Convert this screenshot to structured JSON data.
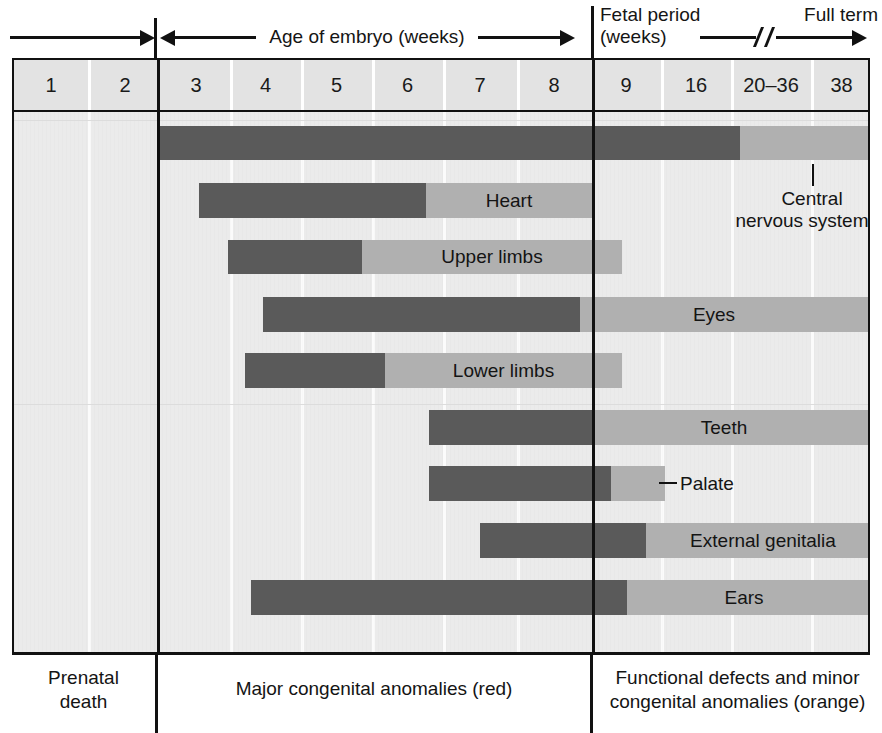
{
  "figure": {
    "axis": {
      "left_segment_label": "",
      "embryo_label": "Age of embryo (weeks)",
      "fetal_label_line1": "Fetal period",
      "fetal_label_line2": "(weeks)",
      "full_term_label": "Full term"
    },
    "week_columns": [
      {
        "label": "1",
        "left": 0,
        "width": 74
      },
      {
        "label": "2",
        "left": 74,
        "width": 74
      },
      {
        "label": "3",
        "left": 148,
        "width": 68
      },
      {
        "label": "4",
        "left": 216,
        "width": 71
      },
      {
        "label": "5",
        "left": 287,
        "width": 71
      },
      {
        "label": "6",
        "left": 358,
        "width": 71
      },
      {
        "label": "7",
        "left": 429,
        "width": 74
      },
      {
        "label": "8",
        "left": 503,
        "width": 74
      },
      {
        "label": "9",
        "left": 577,
        "width": 70
      },
      {
        "label": "16",
        "left": 647,
        "width": 70
      },
      {
        "label": "20–36",
        "left": 717,
        "width": 80
      },
      {
        "label": "38",
        "left": 797,
        "width": 61
      }
    ],
    "structures": [
      {
        "name": "Central nervous system",
        "label_position": "callout",
        "dark_start": 143,
        "dark_end": 726,
        "light_end": 858,
        "top": 14,
        "height": 34
      },
      {
        "name": "Heart",
        "label_position": "inside-light",
        "dark_start": 185,
        "dark_end": 412,
        "light_end": 578,
        "top": 71,
        "height": 35
      },
      {
        "name": "Upper limbs",
        "label_position": "inside-light",
        "dark_start": 214,
        "dark_end": 348,
        "light_end": 608,
        "top": 128,
        "height": 34
      },
      {
        "name": "Eyes",
        "label_position": "inside-light",
        "dark_start": 249,
        "dark_end": 566,
        "light_end": 858,
        "top": 185,
        "height": 35
      },
      {
        "name": "Lower limbs",
        "label_position": "inside-light",
        "dark_start": 231,
        "dark_end": 371,
        "light_end": 608,
        "top": 241,
        "height": 35
      },
      {
        "name": "Teeth",
        "label_position": "inside-light",
        "dark_start": 415,
        "dark_end": 578,
        "light_end": 858,
        "top": 298,
        "height": 35
      },
      {
        "name": "Palate",
        "label_position": "outside-dash",
        "dark_start": 415,
        "dark_end": 597,
        "light_end": 651,
        "top": 354,
        "height": 35
      },
      {
        "name": "External genitalia",
        "label_position": "inside-light",
        "dark_start": 466,
        "dark_end": 632,
        "light_end": 858,
        "top": 411,
        "height": 35
      },
      {
        "name": "Ears",
        "label_position": "inside-light",
        "dark_start": 237,
        "dark_end": 613,
        "light_end": 858,
        "top": 468,
        "height": 35
      }
    ],
    "callout": {
      "line1": "Central",
      "line2": "nervous system"
    },
    "captions": [
      {
        "text": "Prenatal\ndeath",
        "left": 0,
        "width": 143
      },
      {
        "text": "Major congenital anomalies (red)",
        "left": 146,
        "width": 432
      },
      {
        "text": "Functional defects and minor\ncongenital anomalies (orange)",
        "left": 581,
        "width": 277
      }
    ],
    "colors": {
      "dark_bar": "#5a5a5a",
      "light_bar": "#b0b0b0",
      "plot_background": "#ebebeb",
      "header_background": "#e3e3e3",
      "rule": "#111111",
      "text": "#141414"
    },
    "dividers": {
      "prenatal_embryo_x": 143,
      "embryo_fetal_x": 578
    }
  }
}
